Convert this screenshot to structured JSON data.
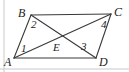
{
  "figure": {
    "type": "geometry-diagram",
    "shape_name": "parallelogram",
    "stroke_color": "#3a3a3a",
    "faint_stroke_color": "#c9c9c9",
    "text_color": "#1d1d1d",
    "background_color": "#ffffff",
    "width": 129,
    "height": 72
  },
  "vertices": [
    {
      "id": "A",
      "label": "A",
      "x": 14,
      "y": 58,
      "label_x": 4,
      "label_y": 56
    },
    {
      "id": "B",
      "label": "B",
      "x": 31,
      "y": 15,
      "label_x": 18,
      "label_y": 7
    },
    {
      "id": "C",
      "label": "C",
      "x": 111,
      "y": 14,
      "label_x": 114,
      "label_y": 6
    },
    {
      "id": "D",
      "label": "D",
      "x": 96,
      "y": 58,
      "label_x": 99,
      "label_y": 56
    }
  ],
  "interior_points": [
    {
      "id": "E",
      "label": "E",
      "x": 62,
      "y": 37,
      "label_x": 53,
      "label_y": 42
    }
  ],
  "sides": [
    {
      "id": "AB",
      "from": "A",
      "to": "B"
    },
    {
      "id": "BC",
      "from": "B",
      "to": "C"
    },
    {
      "id": "CD",
      "from": "C",
      "to": "D"
    },
    {
      "id": "DA",
      "from": "D",
      "to": "A"
    }
  ],
  "diagonals": [
    {
      "id": "AC",
      "from": "A",
      "to": "C"
    },
    {
      "id": "BD",
      "from": "B",
      "to": "D"
    }
  ],
  "angle_labels": [
    {
      "id": "1",
      "label": "1",
      "at_vertex": "A",
      "x": 21,
      "y": 43
    },
    {
      "id": "2",
      "label": "2",
      "at_vertex": "B",
      "x": 31,
      "y": 19
    },
    {
      "id": "3",
      "label": "3",
      "at_vertex": "D",
      "x": 81,
      "y": 41
    },
    {
      "id": "4",
      "label": "4",
      "at_vertex": "C",
      "x": 101,
      "y": 19
    }
  ],
  "margin_rules": [
    {
      "id": "left-rule",
      "x1": 4,
      "y1": 0,
      "x2": 4,
      "y2": 72
    },
    {
      "id": "bottom-rule",
      "x1": 0,
      "y1": 69,
      "x2": 129,
      "y2": 69
    }
  ]
}
